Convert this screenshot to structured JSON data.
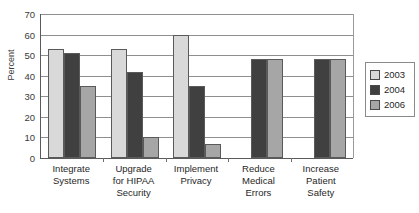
{
  "chart_data": {
    "type": "bar",
    "title": "",
    "xlabel": "",
    "ylabel": "Percent",
    "ylim": [
      0,
      70
    ],
    "yticks": [
      0,
      10,
      20,
      30,
      40,
      50,
      60,
      70
    ],
    "grid": true,
    "legend_position": "right",
    "categories": [
      "Integrate\nSystems",
      "Upgrade\nfor HIPAA\nSecurity",
      "Implement\nPrivacy",
      "Reduce\nMedical\nErrors",
      "Increase\nPatient\nSafety"
    ],
    "series": [
      {
        "name": "2003",
        "color": "#d9d9d9",
        "values": [
          53,
          53,
          60,
          null,
          null
        ]
      },
      {
        "name": "2004",
        "color": "#404040",
        "values": [
          51,
          42,
          35,
          48,
          48
        ]
      },
      {
        "name": "2006",
        "color": "#a6a6a6",
        "values": [
          35,
          10,
          7,
          48,
          48
        ]
      }
    ]
  },
  "legend": {
    "entries": [
      {
        "label": "2003",
        "color": "#d9d9d9"
      },
      {
        "label": "2004",
        "color": "#404040"
      },
      {
        "label": "2006",
        "color": "#a6a6a6"
      }
    ]
  },
  "axis": {
    "y_title": "Percent",
    "y_tick_labels": [
      "70",
      "60",
      "50",
      "40",
      "30",
      "20",
      "10",
      "0"
    ]
  }
}
